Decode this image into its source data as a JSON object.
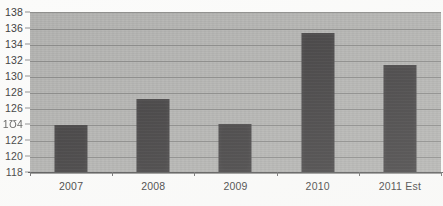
{
  "chart_data": {
    "type": "bar",
    "title": "",
    "subtitle": "",
    "xlabel": "",
    "ylabel": "",
    "categories": [
      "2007",
      "2008",
      "2009",
      "2010",
      "2011 Est"
    ],
    "values": [
      124.0,
      127.2,
      124.1,
      135.5,
      131.5
    ],
    "ylim": [
      118,
      138
    ],
    "ytick_step": 2,
    "yticks": [
      138,
      136,
      134,
      132,
      130,
      128,
      126,
      124,
      122,
      120,
      118
    ],
    "ytick_labels": [
      "138",
      "136",
      "134",
      "132",
      "130",
      "128",
      "126",
      "1Ʊ4",
      "122",
      "120",
      "118"
    ],
    "grid": true,
    "grid_axis": "y",
    "legend": false,
    "legend_position": "none",
    "annotations": [],
    "series": [
      {
        "name": "",
        "values": [
          124.0,
          127.2,
          124.1,
          135.5,
          131.5
        ]
      }
    ]
  },
  "style": {
    "page_background": "#fbfbfa",
    "plot_background": "#b0b0ae",
    "bar_color": "#3f3d3e",
    "gridline_color": "#7e7e7c",
    "axis_color": "#575757",
    "tick_label_color": "#3c3c3c"
  }
}
